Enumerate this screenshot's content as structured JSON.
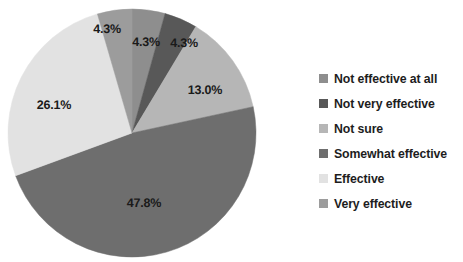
{
  "chart_data": {
    "type": "pie",
    "title": "",
    "subtitle": "",
    "xlabel": "",
    "ylabel": "",
    "legend_position": "right",
    "grid": false,
    "start_angle_deg": 0,
    "direction": "clockwise",
    "categories": [
      "Not effective at all",
      "Not very effective",
      "Not sure",
      "Somewhat effective",
      "Effective",
      "Very effective"
    ],
    "values": [
      4.3,
      4.3,
      13.0,
      47.8,
      26.1,
      4.3
    ],
    "value_unit": "%",
    "colors": [
      "#8e8e8e",
      "#585858",
      "#b6b6b6",
      "#6e6e6e",
      "#e2e2e2",
      "#9c9c9c"
    ],
    "slices": [
      {
        "label": "Not effective at all",
        "value": 4.3,
        "display": "4.3%",
        "color": "#8e8e8e",
        "start_deg": 0.0,
        "end_deg": 15.48,
        "label_x": 146,
        "label_y": 42
      },
      {
        "label": "Not very effective",
        "value": 4.3,
        "display": "4.3%",
        "color": "#585858",
        "start_deg": 15.48,
        "end_deg": 30.96,
        "label_x": 184,
        "label_y": 43
      },
      {
        "label": "Not sure",
        "value": 13.0,
        "display": "13.0%",
        "color": "#b6b6b6",
        "start_deg": 30.96,
        "end_deg": 77.76,
        "label_x": 205,
        "label_y": 90
      },
      {
        "label": "Somewhat effective",
        "value": 47.8,
        "display": "47.8%",
        "color": "#6e6e6e",
        "start_deg": 77.76,
        "end_deg": 249.84,
        "label_x": 144,
        "label_y": 203
      },
      {
        "label": "Effective",
        "value": 26.1,
        "display": "26.1%",
        "color": "#e2e2e2",
        "start_deg": 249.84,
        "end_deg": 343.8,
        "label_x": 54,
        "label_y": 105
      },
      {
        "label": "Very effective",
        "value": 4.3,
        "display": "4.3%",
        "color": "#9c9c9c",
        "start_deg": 343.8,
        "end_deg": 360.0,
        "label_x": 107,
        "label_y": 29
      }
    ],
    "geometry": {
      "center_x": 132,
      "center_y": 133,
      "radius": 124
    }
  },
  "legend": {
    "items": [
      {
        "label": "Not effective at all",
        "color": "#8e8e8e"
      },
      {
        "label": "Not very effective",
        "color": "#585858"
      },
      {
        "label": "Not sure",
        "color": "#b6b6b6"
      },
      {
        "label": "Somewhat effective",
        "color": "#6e6e6e"
      },
      {
        "label": "Effective",
        "color": "#e2e2e2"
      },
      {
        "label": "Very effective",
        "color": "#9c9c9c"
      }
    ]
  }
}
